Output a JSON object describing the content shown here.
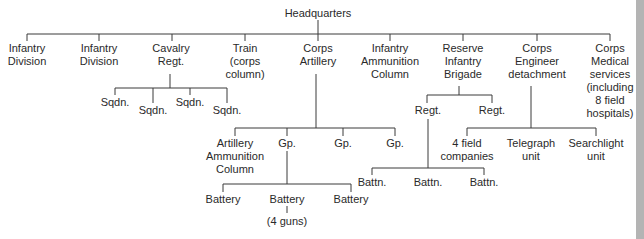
{
  "diagram": {
    "type": "org-chart",
    "root": "Headquarters",
    "nodes": [
      {
        "id": "hq",
        "label": "Headquarters",
        "x": 318,
        "y": 7
      },
      {
        "id": "inf1",
        "label": "Infantry\nDivision",
        "x": 27,
        "y": 42
      },
      {
        "id": "inf2",
        "label": "Infantry\nDivision",
        "x": 99,
        "y": 42
      },
      {
        "id": "cav",
        "label": "Cavalry\nRegt.",
        "x": 171,
        "y": 42
      },
      {
        "id": "train",
        "label": "Train\n(corps\ncolumn)",
        "x": 245,
        "y": 42
      },
      {
        "id": "art",
        "label": "Corps\nArtillery",
        "x": 318,
        "y": 42
      },
      {
        "id": "iac",
        "label": "Infantry\nAmmunition\nColumn",
        "x": 390,
        "y": 42
      },
      {
        "id": "rib",
        "label": "Reserve\nInfantry\nBrigade",
        "x": 463,
        "y": 42
      },
      {
        "id": "eng",
        "label": "Corps\nEngineer\ndetachment",
        "x": 537,
        "y": 42
      },
      {
        "id": "med",
        "label": "Corps\nMedical\nservices\n(including\n8 field\nhospitals)",
        "x": 610,
        "y": 42
      },
      {
        "id": "sq1",
        "label": "Sqdn.",
        "x": 119,
        "y": 96
      },
      {
        "id": "sq2",
        "label": "Sqdn.",
        "x": 153,
        "y": 104
      },
      {
        "id": "sq3",
        "label": "Sqdn.",
        "x": 190,
        "y": 96
      },
      {
        "id": "sq4",
        "label": "Sqdn.",
        "x": 227,
        "y": 104
      },
      {
        "id": "aac",
        "label": "Artillery\nAmmunition\nColumn",
        "x": 235,
        "y": 137
      },
      {
        "id": "gp1",
        "label": "Gp.",
        "x": 287,
        "y": 137
      },
      {
        "id": "gp2",
        "label": "Gp.",
        "x": 343,
        "y": 137
      },
      {
        "id": "gp3",
        "label": "Gp.",
        "x": 395,
        "y": 137
      },
      {
        "id": "bt1",
        "label": "Battery",
        "x": 223,
        "y": 193
      },
      {
        "id": "bt2",
        "label": "Battery",
        "x": 287,
        "y": 193
      },
      {
        "id": "bt3",
        "label": "Battery",
        "x": 351,
        "y": 193
      },
      {
        "id": "guns",
        "label": "(4 guns)",
        "x": 287,
        "y": 215
      },
      {
        "id": "rg1",
        "label": "Regt.",
        "x": 428,
        "y": 104
      },
      {
        "id": "rg2",
        "label": "Regt.",
        "x": 492,
        "y": 104
      },
      {
        "id": "bn1",
        "label": "Battn.",
        "x": 372,
        "y": 176
      },
      {
        "id": "bn2",
        "label": "Battn.",
        "x": 428,
        "y": 176
      },
      {
        "id": "bn3",
        "label": "Battn.",
        "x": 484,
        "y": 176
      },
      {
        "id": "fc",
        "label": "4 field\ncompanies",
        "x": 467,
        "y": 137
      },
      {
        "id": "tel",
        "label": "Telegraph\nunit",
        "x": 531,
        "y": 137
      },
      {
        "id": "sea",
        "label": "Searchlight\nunit",
        "x": 596,
        "y": 137
      }
    ],
    "edges": [
      [
        "hq",
        "inf1"
      ],
      [
        "hq",
        "inf2"
      ],
      [
        "hq",
        "cav"
      ],
      [
        "hq",
        "train"
      ],
      [
        "hq",
        "art"
      ],
      [
        "hq",
        "iac"
      ],
      [
        "hq",
        "rib"
      ],
      [
        "hq",
        "eng"
      ],
      [
        "hq",
        "med"
      ],
      [
        "cav",
        "sq1"
      ],
      [
        "cav",
        "sq2"
      ],
      [
        "cav",
        "sq3"
      ],
      [
        "cav",
        "sq4"
      ],
      [
        "art",
        "aac"
      ],
      [
        "art",
        "gp1"
      ],
      [
        "art",
        "gp2"
      ],
      [
        "art",
        "gp3"
      ],
      [
        "gp1",
        "bt1"
      ],
      [
        "gp1",
        "bt2"
      ],
      [
        "gp1",
        "bt3"
      ],
      [
        "bt2",
        "guns"
      ],
      [
        "rib",
        "rg1"
      ],
      [
        "rib",
        "rg2"
      ],
      [
        "rg1",
        "bn1"
      ],
      [
        "rg1",
        "bn2"
      ],
      [
        "rg1",
        "bn3"
      ],
      [
        "eng",
        "fc"
      ],
      [
        "eng",
        "tel"
      ],
      [
        "eng",
        "sea"
      ]
    ],
    "colors": {
      "line": "#3a3a3a",
      "text": "#2a2a2a",
      "background": "#ffffff",
      "edge_strip": "#b4b4b4"
    }
  }
}
